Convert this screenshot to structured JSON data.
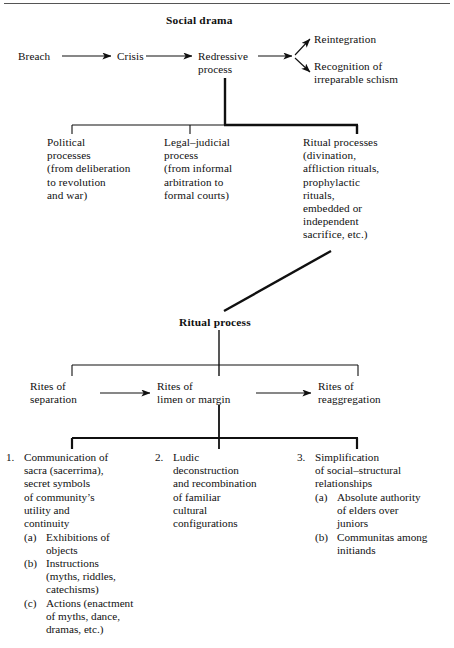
{
  "diagram": {
    "title": "Social drama",
    "top_sequence": [
      {
        "label": "Breach"
      },
      {
        "label": "Crisis"
      },
      {
        "label": "Redressive\nprocess"
      }
    ],
    "outcomes": [
      {
        "label": "Reintegration"
      },
      {
        "label": "Recognition of\nirreparable schism"
      }
    ],
    "redressive_branches": [
      {
        "label": "Political\nprocesses\n(from deliberation\nto revolution\nand war)"
      },
      {
        "label": "Legal–judicial\nprocess\n(from informal\narbitration to\nformal courts)"
      },
      {
        "label": "Ritual processes\n(divination,\naffliction rituals,\nprophylactic\nrituals,\nembedded or\nindependent\nsacrifice, etc.)"
      }
    ],
    "ritual_process": {
      "title": "Ritual process",
      "phases": [
        {
          "label": "Rites of\nseparation"
        },
        {
          "label": "Rites of\nlimen or margin"
        },
        {
          "label": "Rites of\nreaggregation"
        }
      ],
      "features": [
        {
          "number": "1.",
          "text": "Communication of\nsacra (sacerrima),\nsecret symbols\nof community’s\nutility and\ncontinuity",
          "sub": [
            {
              "marker": "(a)",
              "text": "Exhibitions of\nobjects"
            },
            {
              "marker": "(b)",
              "text": "Instructions\n(myths, riddles,\ncatechisms)"
            },
            {
              "marker": "(c)",
              "text": "Actions (enactment\nof myths, dance,\ndramas, etc.)"
            }
          ]
        },
        {
          "number": "2.",
          "text": "Ludic\ndeconstruction\nand recombination\nof familiar\ncultural\nconfigurations",
          "sub": []
        },
        {
          "number": "3.",
          "text": "Simplification\nof social–structural\nrelationships",
          "sub": [
            {
              "marker": "(a)",
              "text": "Absolute authority\nof elders over\njuniors"
            },
            {
              "marker": "(b)",
              "text": "Communitas among\ninitiands"
            }
          ]
        }
      ]
    },
    "colors": {
      "ink": "#101010",
      "rule": "#555555",
      "background": "#ffffff"
    }
  }
}
